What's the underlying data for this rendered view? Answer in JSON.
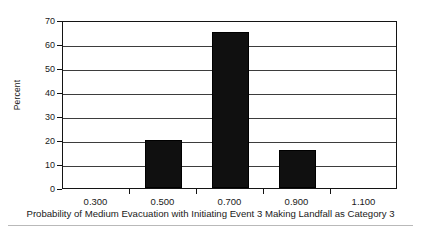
{
  "chart_data": {
    "type": "bar",
    "title": "",
    "subtitle": "",
    "xlabel": "Probability of Medium Evacuation with Initiating Event 3 Making Landfall as Category 3",
    "ylabel": "Percent",
    "categories": [
      "0.300",
      "0.500",
      "0.700",
      "0.900",
      "1.100"
    ],
    "values": [
      0,
      20,
      65,
      16,
      0
    ],
    "ylim": [
      0,
      70
    ],
    "yticks": [
      0,
      10,
      20,
      30,
      40,
      50,
      60,
      70
    ],
    "ytick_labels": [
      "0",
      "10",
      "20",
      "30",
      "40",
      "50",
      "60",
      "70"
    ],
    "xtick_labels": [
      "0.300",
      "0.500",
      "0.700",
      "0.900",
      "1.100"
    ],
    "grid": "horizontal",
    "legend": "none",
    "bar_color": "#101010",
    "axis_color": "#141414",
    "grid_color": "#3d3d3d",
    "background": "#ffffff",
    "bars": [
      {
        "category": "0.300",
        "value": 0
      },
      {
        "category": "0.500",
        "value": 20
      },
      {
        "category": "0.700",
        "value": 65
      },
      {
        "category": "0.900",
        "value": 16
      },
      {
        "category": "1.100",
        "value": 0
      }
    ]
  }
}
